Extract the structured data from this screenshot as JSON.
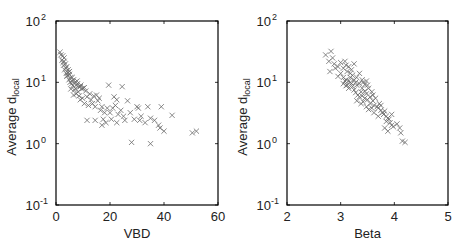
{
  "chart_data": [
    {
      "type": "scatter",
      "title": "",
      "xlabel": "VBD",
      "ylabel": "Average d_local",
      "ylabel_main": "Average d",
      "ylabel_sub": "local",
      "xlim": [
        0,
        60
      ],
      "ylim": [
        0.1,
        100
      ],
      "yscale": "log",
      "xticks": [
        0,
        20,
        40,
        60
      ],
      "xtick_labels": [
        "0",
        "20",
        "40",
        "60"
      ],
      "yticks": [
        0.1,
        1,
        10,
        100
      ],
      "ytick_labels": [
        {
          "base": "10",
          "exp": "-1"
        },
        {
          "base": "10",
          "exp": "0"
        },
        {
          "base": "10",
          "exp": "1"
        },
        {
          "base": "10",
          "exp": "2"
        }
      ],
      "grid": false,
      "marker": "x",
      "points": [
        [
          1.5,
          31
        ],
        [
          2.5,
          27
        ],
        [
          3.0,
          22
        ],
        [
          2.8,
          19
        ],
        [
          3.5,
          20
        ],
        [
          4.0,
          18
        ],
        [
          3.2,
          16
        ],
        [
          4.5,
          16
        ],
        [
          3.8,
          14
        ],
        [
          5.0,
          15
        ],
        [
          4.2,
          13
        ],
        [
          5.5,
          12
        ],
        [
          4.8,
          11
        ],
        [
          6.0,
          12
        ],
        [
          5.2,
          10
        ],
        [
          6.5,
          11
        ],
        [
          7.0,
          10
        ],
        [
          5.8,
          9.5
        ],
        [
          7.5,
          9
        ],
        [
          6.2,
          8.8
        ],
        [
          8.0,
          9.5
        ],
        [
          8.5,
          8.5
        ],
        [
          7.2,
          8
        ],
        [
          9.0,
          8.5
        ],
        [
          9.5,
          7.8
        ],
        [
          6.8,
          7.5
        ],
        [
          10.0,
          8
        ],
        [
          8.2,
          7
        ],
        [
          11.0,
          7.2
        ],
        [
          5.5,
          7.8
        ],
        [
          4.0,
          12.5
        ],
        [
          3.6,
          17
        ],
        [
          2.2,
          23
        ],
        [
          1.8,
          28
        ],
        [
          2.6,
          21
        ],
        [
          5.0,
          13.5
        ],
        [
          6.0,
          10.5
        ],
        [
          7.8,
          10.5
        ],
        [
          9.2,
          9
        ],
        [
          10.5,
          8.2
        ],
        [
          6.5,
          6.2
        ],
        [
          7.5,
          6.5
        ],
        [
          8.5,
          6
        ],
        [
          9.8,
          5.5
        ],
        [
          11.5,
          5.8
        ],
        [
          12.5,
          6.5
        ],
        [
          13.0,
          5.2
        ],
        [
          14.0,
          6.0
        ],
        [
          15.0,
          6.2
        ],
        [
          15.5,
          5.0
        ],
        [
          13.5,
          4.5
        ],
        [
          16.0,
          5.5
        ],
        [
          12.0,
          4.2
        ],
        [
          14.5,
          4.0
        ],
        [
          10.5,
          4.5
        ],
        [
          9.0,
          5.2
        ],
        [
          17.0,
          4.0
        ],
        [
          16.5,
          3.5
        ],
        [
          18.0,
          3.2
        ],
        [
          19.0,
          3.8
        ],
        [
          20.0,
          3.2
        ],
        [
          21.0,
          3.8
        ],
        [
          22.0,
          4.2
        ],
        [
          23.0,
          3.0
        ],
        [
          24.0,
          3.5
        ],
        [
          25.0,
          2.8
        ],
        [
          20.5,
          2.5
        ],
        [
          22.5,
          2.2
        ],
        [
          17.5,
          2.5
        ],
        [
          18.5,
          2.2
        ],
        [
          19.5,
          9
        ],
        [
          24.5,
          8.5
        ],
        [
          21.5,
          5.8
        ],
        [
          22.5,
          5.2
        ],
        [
          26.5,
          5.0
        ],
        [
          27.5,
          3.2
        ],
        [
          30.0,
          4.0
        ],
        [
          30.5,
          3.8
        ],
        [
          34.0,
          4.0
        ],
        [
          31.5,
          2.8
        ],
        [
          31.0,
          2.4
        ],
        [
          33.0,
          2.2
        ],
        [
          35.0,
          2.6
        ],
        [
          36.5,
          2.4
        ],
        [
          38.0,
          2.0
        ],
        [
          38.5,
          1.8
        ],
        [
          40.0,
          1.6
        ],
        [
          39.0,
          4.0
        ],
        [
          43.0,
          2.9
        ],
        [
          29.0,
          2.5
        ],
        [
          25.5,
          2.4
        ],
        [
          17.0,
          2.0
        ],
        [
          14.5,
          2.4
        ],
        [
          11.5,
          2.4
        ],
        [
          28.0,
          1.05
        ],
        [
          35.0,
          1.0
        ],
        [
          50.5,
          1.5
        ],
        [
          52.0,
          1.6
        ],
        [
          3.0,
          25
        ],
        [
          4.5,
          14.5
        ]
      ]
    },
    {
      "type": "scatter",
      "title": "",
      "xlabel": "Beta",
      "ylabel": "Average d_local",
      "ylabel_main": "Average d",
      "ylabel_sub": "local",
      "xlim": [
        2,
        5
      ],
      "ylim": [
        0.1,
        100
      ],
      "yscale": "log",
      "xticks": [
        2,
        3,
        4,
        5
      ],
      "xtick_labels": [
        "2",
        "3",
        "4",
        "5"
      ],
      "yticks": [
        0.1,
        1,
        10,
        100
      ],
      "ytick_labels": [
        {
          "base": "10",
          "exp": "-1"
        },
        {
          "base": "10",
          "exp": "0"
        },
        {
          "base": "10",
          "exp": "1"
        },
        {
          "base": "10",
          "exp": "2"
        }
      ],
      "grid": false,
      "marker": "x",
      "points": [
        [
          2.72,
          28
        ],
        [
          2.82,
          32
        ],
        [
          2.85,
          25
        ],
        [
          2.78,
          22
        ],
        [
          2.88,
          20
        ],
        [
          2.9,
          17
        ],
        [
          2.8,
          15
        ],
        [
          2.95,
          18
        ],
        [
          3.0,
          21
        ],
        [
          3.05,
          17
        ],
        [
          3.08,
          22
        ],
        [
          3.1,
          19
        ],
        [
          3.12,
          15
        ],
        [
          3.15,
          18
        ],
        [
          3.18,
          14
        ],
        [
          3.2,
          16
        ],
        [
          3.22,
          13
        ],
        [
          3.05,
          12
        ],
        [
          3.1,
          11
        ],
        [
          3.15,
          10.5
        ],
        [
          3.18,
          10
        ],
        [
          3.2,
          9.5
        ],
        [
          3.12,
          9
        ],
        [
          3.25,
          11
        ],
        [
          3.28,
          10
        ],
        [
          3.3,
          9
        ],
        [
          3.22,
          8.5
        ],
        [
          3.35,
          9.5
        ],
        [
          3.1,
          8.8
        ],
        [
          3.15,
          8
        ],
        [
          3.3,
          12
        ],
        [
          3.35,
          14
        ],
        [
          3.25,
          7.5
        ],
        [
          3.28,
          6.8
        ],
        [
          3.32,
          6.2
        ],
        [
          3.38,
          7
        ],
        [
          3.4,
          8
        ],
        [
          3.42,
          10
        ],
        [
          3.45,
          9.2
        ],
        [
          3.48,
          10.5
        ],
        [
          3.5,
          9
        ],
        [
          3.52,
          8
        ],
        [
          3.4,
          6
        ],
        [
          3.45,
          5.5
        ],
        [
          3.48,
          6.5
        ],
        [
          3.35,
          5.8
        ],
        [
          3.5,
          5.2
        ],
        [
          3.55,
          5.8
        ],
        [
          3.58,
          7
        ],
        [
          3.6,
          5
        ],
        [
          3.3,
          5
        ],
        [
          3.38,
          4.5
        ],
        [
          3.42,
          4.8
        ],
        [
          3.55,
          4.5
        ],
        [
          3.62,
          4.2
        ],
        [
          3.65,
          5.5
        ],
        [
          3.68,
          4.0
        ],
        [
          3.7,
          3.8
        ],
        [
          3.58,
          3.8
        ],
        [
          3.52,
          3.6
        ],
        [
          3.72,
          4.5
        ],
        [
          3.75,
          3.5
        ],
        [
          3.78,
          3.2
        ],
        [
          3.8,
          3.0
        ],
        [
          3.82,
          3.4
        ],
        [
          3.85,
          2.8
        ],
        [
          3.88,
          2.6
        ],
        [
          3.9,
          2.5
        ],
        [
          3.85,
          2.3
        ],
        [
          3.92,
          2.2
        ],
        [
          3.95,
          2.0
        ],
        [
          3.82,
          1.8
        ],
        [
          3.88,
          1.6
        ],
        [
          3.98,
          1.9
        ],
        [
          4.05,
          2.1
        ],
        [
          4.1,
          1.8
        ],
        [
          4.12,
          1.5
        ],
        [
          4.15,
          1.1
        ],
        [
          4.2,
          1.05
        ],
        [
          3.7,
          2.8
        ],
        [
          3.62,
          3.2
        ],
        [
          3.48,
          4.0
        ],
        [
          3.0,
          14
        ],
        [
          2.95,
          12.5
        ],
        [
          3.25,
          20
        ],
        [
          3.45,
          7.2
        ],
        [
          3.6,
          6.2
        ],
        [
          3.75,
          4.2
        ],
        [
          3.95,
          3.0
        ],
        [
          3.4,
          11
        ],
        [
          3.05,
          9.5
        ],
        [
          3.18,
          12
        ],
        [
          3.08,
          10.5
        ]
      ]
    }
  ],
  "background_text_lines": [
    "modularity analysis suggests that a useful method to",
    "identify...",
    "Conclusion"
  ]
}
